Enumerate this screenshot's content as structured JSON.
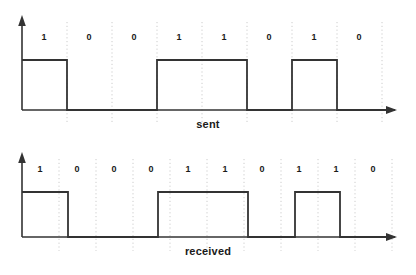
{
  "figure": {
    "title": "",
    "background": "#ffffff",
    "line_color": "#333333",
    "grid_color": "#cccccc",
    "text_color": "#1a1a1a"
  },
  "charts": [
    {
      "id": "sent",
      "caption": "sent",
      "bits": [
        "1",
        "0",
        "0",
        "1",
        "1",
        "0",
        "1",
        "0"
      ]
    },
    {
      "id": "received",
      "caption": "received",
      "bits": [
        "1",
        "0",
        "0",
        "0",
        "1",
        "1",
        "0",
        "1",
        "1",
        "0"
      ]
    }
  ],
  "chart_data": {
    "type": "line",
    "title": "",
    "xlabel": "",
    "ylabel": "",
    "grid": true,
    "legend": "none",
    "series": [
      {
        "name": "sent",
        "caption": "sent",
        "bits": [
          1,
          0,
          0,
          1,
          1,
          0,
          1,
          0
        ],
        "bit_count": 8,
        "bit_string": "10011010",
        "axis": {
          "origin_x": 22,
          "baseline_y": 110,
          "high_y": 60,
          "cell_width": 45,
          "axis_end_x": 395,
          "arrow_top_y": 18
        },
        "gridlines_x": [
          67,
          112,
          157,
          202,
          247,
          292,
          337,
          382
        ],
        "label_x": [
          44,
          89,
          134,
          179,
          224,
          269,
          314,
          359
        ],
        "label_y": 40,
        "waveform_points": [
          [
            22,
            60
          ],
          [
            67,
            60
          ],
          [
            67,
            110
          ],
          [
            157,
            110
          ],
          [
            157,
            60
          ],
          [
            247,
            60
          ],
          [
            247,
            110
          ],
          [
            292,
            110
          ],
          [
            292,
            60
          ],
          [
            337,
            60
          ],
          [
            337,
            110
          ],
          [
            395,
            110
          ]
        ]
      },
      {
        "name": "received",
        "caption": "received",
        "bits": [
          1,
          0,
          0,
          0,
          1,
          1,
          0,
          1,
          1,
          0
        ],
        "bit_count": 10,
        "bit_string": "1000110110",
        "axis": {
          "origin_x": 22,
          "baseline_y": 237,
          "high_y": 192,
          "cell_width": 37,
          "axis_end_x": 395,
          "arrow_top_y": 155
        },
        "gridlines_x": [
          59,
          96,
          133,
          170,
          207,
          244,
          281,
          318,
          355,
          392
        ],
        "label_x": [
          40,
          77,
          114,
          151,
          188,
          225,
          262,
          299,
          336,
          373
        ],
        "label_y": 172,
        "waveform_points": [
          [
            22,
            192
          ],
          [
            68,
            192
          ],
          [
            68,
            237
          ],
          [
            158,
            237
          ],
          [
            158,
            192
          ],
          [
            248,
            192
          ],
          [
            248,
            237
          ],
          [
            295,
            237
          ],
          [
            295,
            192
          ],
          [
            340,
            192
          ],
          [
            340,
            237
          ],
          [
            395,
            237
          ]
        ]
      }
    ]
  }
}
